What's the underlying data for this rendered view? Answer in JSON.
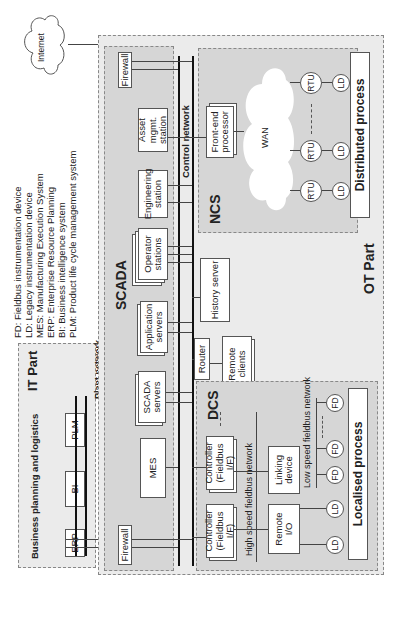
{
  "legend": [
    "FD: Fieldbus instrumentation device",
    "LD: Legacy instrumentation device",
    "MES: Manufacturing Execution System",
    "ERP: Enterprise Resource Planning",
    "BI: Business intelligence system",
    "PLM: Product life cycle management system"
  ],
  "internet": "Internet",
  "it_part": {
    "title": "IT Part",
    "subtitle": "Business planning and logistics",
    "boxes": [
      "ERP",
      "BI",
      "PLM"
    ],
    "network": "Plant network"
  },
  "ot_part": {
    "title": "OT Part",
    "control_network": "Control network",
    "scada": {
      "title": "SCADA",
      "firewall_left": "Firewall",
      "firewall_right": "Firewall",
      "mes": "MES",
      "scada_servers": "SCADA servers",
      "application_servers": "Application servers",
      "operator_stations": "Operator stations",
      "engineering_station": "Engineering station",
      "asset_station": "Asset mgmt. station"
    },
    "router": "Router",
    "remote_clients": "Remote clients",
    "history_server": "History server",
    "dcs": {
      "title": "DCS",
      "controller1": "Controller (Fieldbus I/F)",
      "controller2": "Controller (Fieldbus I/F)",
      "high_speed": "High speed fieldbus network",
      "remote_io": "Remote I/O",
      "linking_device": "Linking device",
      "low_speed": "Low speed fieldbus network",
      "ld": "LD",
      "fd": "FD",
      "process": "Localised process"
    },
    "ncs": {
      "title": "NCS",
      "front_end": "Front-end processor",
      "wan": "WAN",
      "rtu": "RTU",
      "ld": "LD",
      "process": "Distributed process"
    }
  }
}
